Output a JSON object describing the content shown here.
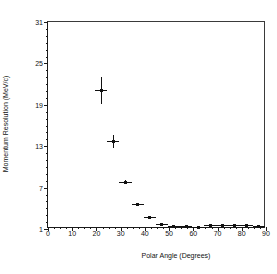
{
  "chart_data": {
    "type": "scatter",
    "title": "",
    "xlabel": "Polar Angle (Degrees)",
    "ylabel": "Momentum Resolution (MeV/c)",
    "xlim": [
      0,
      90
    ],
    "ylim": [
      1,
      31
    ],
    "xticks": [
      0,
      10,
      20,
      30,
      40,
      50,
      60,
      70,
      80,
      90
    ],
    "xticklabels": [
      "0",
      "10",
      "20",
      "30",
      "40",
      "50",
      "60",
      "70",
      "80",
      "90"
    ],
    "yticks": [
      1,
      7,
      13,
      19,
      25,
      31
    ],
    "yticklabels": [
      "1",
      "7",
      "13",
      "19",
      "25",
      "31"
    ],
    "grid": false,
    "legend": null,
    "annotations": [
      "KLOE Drift Chamber",
      "Preliminary"
    ],
    "series": [
      {
        "name": "Momentum resolution vs polar angle",
        "marker": "square",
        "color": "#111111",
        "x": [
          22,
          27,
          32,
          37,
          42,
          47,
          52,
          57,
          62,
          67,
          72,
          77,
          82,
          87
        ],
        "y": [
          21.1,
          13.7,
          7.8,
          4.6,
          2.6,
          1.7,
          1.4,
          1.4,
          1.25,
          1.5,
          1.45,
          1.5,
          1.45,
          1.4
        ],
        "yerr": [
          2.0,
          0.9,
          0.25,
          0.15,
          0.1,
          0.06,
          0.05,
          0.05,
          0.05,
          0.05,
          0.05,
          0.05,
          0.05,
          0.05
        ],
        "xerr": [
          2.5,
          2.5,
          2.5,
          2.5,
          2.5,
          2.5,
          2.5,
          2.5,
          2.5,
          2.5,
          2.5,
          2.5,
          2.5,
          2.5
        ]
      }
    ]
  }
}
